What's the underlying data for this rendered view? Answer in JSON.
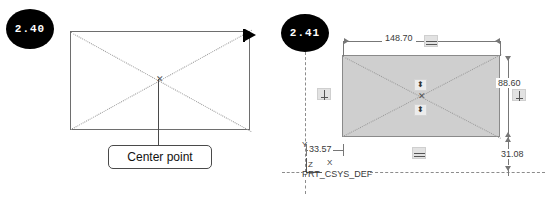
{
  "figure": {
    "panels": [
      {
        "step_badge": "2.40",
        "caption_callout": "Center point",
        "shape": "rectangle",
        "cursor": "arrow-cursor"
      },
      {
        "step_badge": "2.41",
        "shape": "rectangle-filled",
        "csys_label": "PRT_CSYS_DEF",
        "axes": {
          "x": "X",
          "y": "Y",
          "z": "Z"
        },
        "dimensions": [
          {
            "name": "width",
            "value": "148.70",
            "position": "top"
          },
          {
            "name": "height",
            "value": "88.60",
            "position": "right"
          },
          {
            "name": "offset_vertical",
            "value": "31.08",
            "position": "bottom-right"
          },
          {
            "name": "offset_horizontal",
            "value": "33.57",
            "position": "bottom-left"
          }
        ],
        "constraint_icons": [
          "vertical-constraint-icon",
          "vertical-constraint-icon",
          "horizontal-constraint-icon",
          "horizontal-constraint-icon"
        ],
        "symmetry_icons": [
          "symmetry-icon",
          "symmetry-icon"
        ]
      }
    ]
  },
  "colors": {
    "badge_bg": "#000000",
    "badge_text": "#ffffff",
    "fill_gray": "#cfcfcf",
    "outline": "#6e6e6e",
    "dimension_text": "#3a3a3a"
  }
}
